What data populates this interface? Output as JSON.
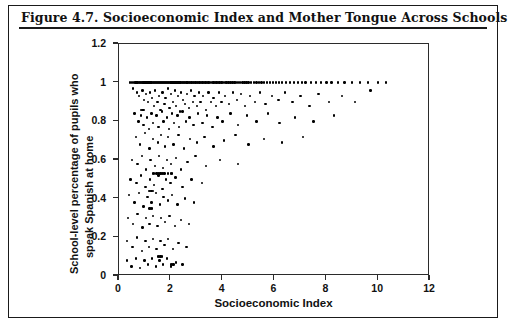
{
  "figure": {
    "title": "Figure 4.7.  Socioeconomic Index and Mother Tongue Across Schools"
  },
  "chart_data": {
    "type": "scatter",
    "title": "Socioeconomic Index and Mother Tongue Across Schools",
    "xlabel": "Socioeconomic Index",
    "ylabel_line1": "School-level percentage of pupils who",
    "ylabel_line2": "speak Spanish at home",
    "xlim": [
      0,
      12
    ],
    "ylim": [
      0,
      1.2
    ],
    "xticks": [
      0,
      2,
      4,
      6,
      8,
      10,
      12
    ],
    "xtick_labels": [
      "0",
      "2",
      "4",
      "6",
      "8",
      "10",
      "12"
    ],
    "yticks": [
      0,
      0.2,
      0.4,
      0.6,
      0.8,
      1,
      1.2
    ],
    "ytick_labels": [
      "0",
      "0.2",
      "0.4",
      "0.6",
      "0.8",
      "1",
      "1.2"
    ],
    "grid": false,
    "legend": null,
    "marker": "filled-circle",
    "marker_color": "#000000",
    "marker_size_px": 2.4,
    "points": [
      [
        0.42,
        1.0
      ],
      [
        0.5,
        1.0
      ],
      [
        0.58,
        1.0
      ],
      [
        0.63,
        1.0
      ],
      [
        0.68,
        1.0
      ],
      [
        0.72,
        1.0
      ],
      [
        0.76,
        1.0
      ],
      [
        0.8,
        1.0
      ],
      [
        0.84,
        1.0
      ],
      [
        0.88,
        1.0
      ],
      [
        0.92,
        1.0
      ],
      [
        0.95,
        1.0
      ],
      [
        0.99,
        1.0
      ],
      [
        1.02,
        1.0
      ],
      [
        1.06,
        1.0
      ],
      [
        1.1,
        1.0
      ],
      [
        1.14,
        1.0
      ],
      [
        1.18,
        1.0
      ],
      [
        1.22,
        1.0
      ],
      [
        1.26,
        1.0
      ],
      [
        1.3,
        1.0
      ],
      [
        1.34,
        1.0
      ],
      [
        1.38,
        1.0
      ],
      [
        1.42,
        1.0
      ],
      [
        1.46,
        1.0
      ],
      [
        1.5,
        1.0
      ],
      [
        1.54,
        1.0
      ],
      [
        1.58,
        1.0
      ],
      [
        1.62,
        1.0
      ],
      [
        1.66,
        1.0
      ],
      [
        1.7,
        1.0
      ],
      [
        1.74,
        1.0
      ],
      [
        1.78,
        1.0
      ],
      [
        1.82,
        1.0
      ],
      [
        1.86,
        1.0
      ],
      [
        1.9,
        1.0
      ],
      [
        1.94,
        1.0
      ],
      [
        1.98,
        1.0
      ],
      [
        2.02,
        1.0
      ],
      [
        2.06,
        1.0
      ],
      [
        2.1,
        1.0
      ],
      [
        2.14,
        1.0
      ],
      [
        2.18,
        1.0
      ],
      [
        2.22,
        1.0
      ],
      [
        2.26,
        1.0
      ],
      [
        2.3,
        1.0
      ],
      [
        2.34,
        1.0
      ],
      [
        2.38,
        1.0
      ],
      [
        2.42,
        1.0
      ],
      [
        2.46,
        1.0
      ],
      [
        2.5,
        1.0
      ],
      [
        2.55,
        1.0
      ],
      [
        2.6,
        1.0
      ],
      [
        2.65,
        1.0
      ],
      [
        2.7,
        1.0
      ],
      [
        2.75,
        1.0
      ],
      [
        2.8,
        1.0
      ],
      [
        2.85,
        1.0
      ],
      [
        2.9,
        1.0
      ],
      [
        2.95,
        1.0
      ],
      [
        3.0,
        1.0
      ],
      [
        3.05,
        1.0
      ],
      [
        3.1,
        1.0
      ],
      [
        3.16,
        1.0
      ],
      [
        3.22,
        1.0
      ],
      [
        3.28,
        1.0
      ],
      [
        3.34,
        1.0
      ],
      [
        3.4,
        1.0
      ],
      [
        3.46,
        1.0
      ],
      [
        3.52,
        1.0
      ],
      [
        3.58,
        1.0
      ],
      [
        3.64,
        1.0
      ],
      [
        3.7,
        1.0
      ],
      [
        3.76,
        1.0
      ],
      [
        3.82,
        1.0
      ],
      [
        3.88,
        1.0
      ],
      [
        3.95,
        1.0
      ],
      [
        4.02,
        1.0
      ],
      [
        4.08,
        1.0
      ],
      [
        4.15,
        1.0
      ],
      [
        4.22,
        1.0
      ],
      [
        4.3,
        1.0
      ],
      [
        4.38,
        1.0
      ],
      [
        4.45,
        1.0
      ],
      [
        4.52,
        1.0
      ],
      [
        4.6,
        1.0
      ],
      [
        4.68,
        1.0
      ],
      [
        4.76,
        1.0
      ],
      [
        4.84,
        1.0
      ],
      [
        4.92,
        1.0
      ],
      [
        5.0,
        1.0
      ],
      [
        5.1,
        1.0
      ],
      [
        5.2,
        1.0
      ],
      [
        5.3,
        1.0
      ],
      [
        5.4,
        1.0
      ],
      [
        5.5,
        1.0
      ],
      [
        5.6,
        1.0
      ],
      [
        5.7,
        1.0
      ],
      [
        5.82,
        1.0
      ],
      [
        5.94,
        1.0
      ],
      [
        6.05,
        1.0
      ],
      [
        6.18,
        1.0
      ],
      [
        6.3,
        1.0
      ],
      [
        6.45,
        1.0
      ],
      [
        6.6,
        1.0
      ],
      [
        6.75,
        1.0
      ],
      [
        6.9,
        1.0
      ],
      [
        7.05,
        1.0
      ],
      [
        7.2,
        1.0
      ],
      [
        7.4,
        1.0
      ],
      [
        7.6,
        1.0
      ],
      [
        7.8,
        1.0
      ],
      [
        8.0,
        1.0
      ],
      [
        8.2,
        1.0
      ],
      [
        8.45,
        1.0
      ],
      [
        8.7,
        1.0
      ],
      [
        9.0,
        1.0
      ],
      [
        9.3,
        1.0
      ],
      [
        9.6,
        1.0
      ],
      [
        10.0,
        1.0
      ],
      [
        10.3,
        1.0
      ],
      [
        0.55,
        0.97
      ],
      [
        0.7,
        0.95
      ],
      [
        0.78,
        0.93
      ],
      [
        0.9,
        0.96
      ],
      [
        0.97,
        0.91
      ],
      [
        1.05,
        0.94
      ],
      [
        1.12,
        0.9
      ],
      [
        1.2,
        0.95
      ],
      [
        1.28,
        0.92
      ],
      [
        1.35,
        0.88
      ],
      [
        1.4,
        0.96
      ],
      [
        1.48,
        0.9
      ],
      [
        1.55,
        0.93
      ],
      [
        1.6,
        0.86
      ],
      [
        1.68,
        0.95
      ],
      [
        1.75,
        0.89
      ],
      [
        1.8,
        0.92
      ],
      [
        1.88,
        0.97
      ],
      [
        1.95,
        0.87
      ],
      [
        2.0,
        0.94
      ],
      [
        2.08,
        0.9
      ],
      [
        2.15,
        0.96
      ],
      [
        2.2,
        0.88
      ],
      [
        2.28,
        0.93
      ],
      [
        2.35,
        0.85
      ],
      [
        2.4,
        0.95
      ],
      [
        2.48,
        0.91
      ],
      [
        2.55,
        0.89
      ],
      [
        2.62,
        0.94
      ],
      [
        2.7,
        0.87
      ],
      [
        2.78,
        0.96
      ],
      [
        2.85,
        0.9
      ],
      [
        2.92,
        0.93
      ],
      [
        3.0,
        0.88
      ],
      [
        3.08,
        0.95
      ],
      [
        3.15,
        0.9
      ],
      [
        3.25,
        0.93
      ],
      [
        3.35,
        0.86
      ],
      [
        3.45,
        0.95
      ],
      [
        3.55,
        0.9
      ],
      [
        3.65,
        0.92
      ],
      [
        3.75,
        0.88
      ],
      [
        3.85,
        0.95
      ],
      [
        3.95,
        0.9
      ],
      [
        4.1,
        0.93
      ],
      [
        4.25,
        0.89
      ],
      [
        4.4,
        0.95
      ],
      [
        4.55,
        0.91
      ],
      [
        4.7,
        0.94
      ],
      [
        4.85,
        0.88
      ],
      [
        5.05,
        0.93
      ],
      [
        5.25,
        0.9
      ],
      [
        5.45,
        0.95
      ],
      [
        5.65,
        0.89
      ],
      [
        5.9,
        0.93
      ],
      [
        6.15,
        0.91
      ],
      [
        6.4,
        0.95
      ],
      [
        6.7,
        0.9
      ],
      [
        7.0,
        0.93
      ],
      [
        7.35,
        0.88
      ],
      [
        7.7,
        0.94
      ],
      [
        8.1,
        0.9
      ],
      [
        8.6,
        0.93
      ],
      [
        9.1,
        0.9
      ],
      [
        9.7,
        0.96
      ],
      [
        0.6,
        0.84
      ],
      [
        0.75,
        0.8
      ],
      [
        0.85,
        0.83
      ],
      [
        0.95,
        0.78
      ],
      [
        1.08,
        0.82
      ],
      [
        1.15,
        0.76
      ],
      [
        1.25,
        0.84
      ],
      [
        1.32,
        0.79
      ],
      [
        1.45,
        0.83
      ],
      [
        1.52,
        0.77
      ],
      [
        1.65,
        0.85
      ],
      [
        1.72,
        0.8
      ],
      [
        1.85,
        0.82
      ],
      [
        1.92,
        0.76
      ],
      [
        2.05,
        0.84
      ],
      [
        2.12,
        0.79
      ],
      [
        2.25,
        0.83
      ],
      [
        2.32,
        0.77
      ],
      [
        2.45,
        0.85
      ],
      [
        2.58,
        0.8
      ],
      [
        2.72,
        0.82
      ],
      [
        2.88,
        0.78
      ],
      [
        3.05,
        0.84
      ],
      [
        3.22,
        0.79
      ],
      [
        3.4,
        0.83
      ],
      [
        3.6,
        0.77
      ],
      [
        3.8,
        0.82
      ],
      [
        4.0,
        0.8
      ],
      [
        4.3,
        0.84
      ],
      [
        4.6,
        0.78
      ],
      [
        4.95,
        0.83
      ],
      [
        5.3,
        0.8
      ],
      [
        5.75,
        0.84
      ],
      [
        6.2,
        0.79
      ],
      [
        6.8,
        0.82
      ],
      [
        7.5,
        0.8
      ],
      [
        8.3,
        0.83
      ],
      [
        0.65,
        0.72
      ],
      [
        0.82,
        0.68
      ],
      [
        1.0,
        0.74
      ],
      [
        1.18,
        0.66
      ],
      [
        1.3,
        0.71
      ],
      [
        1.5,
        0.69
      ],
      [
        1.62,
        0.73
      ],
      [
        1.78,
        0.67
      ],
      [
        1.9,
        0.72
      ],
      [
        2.1,
        0.68
      ],
      [
        2.3,
        0.73
      ],
      [
        2.5,
        0.66
      ],
      [
        2.75,
        0.71
      ],
      [
        3.0,
        0.69
      ],
      [
        3.3,
        0.72
      ],
      [
        3.65,
        0.67
      ],
      [
        4.05,
        0.7
      ],
      [
        4.5,
        0.73
      ],
      [
        5.0,
        0.68
      ],
      [
        5.6,
        0.71
      ],
      [
        6.3,
        0.69
      ],
      [
        7.1,
        0.72
      ],
      [
        0.5,
        0.6
      ],
      [
        0.72,
        0.58
      ],
      [
        0.88,
        0.62
      ],
      [
        1.05,
        0.55
      ],
      [
        1.22,
        0.6
      ],
      [
        1.38,
        0.57
      ],
      [
        1.55,
        0.62
      ],
      [
        1.7,
        0.56
      ],
      [
        1.85,
        0.6
      ],
      [
        2.0,
        0.58
      ],
      [
        2.2,
        0.61
      ],
      [
        2.4,
        0.55
      ],
      [
        2.65,
        0.59
      ],
      [
        2.95,
        0.62
      ],
      [
        3.35,
        0.57
      ],
      [
        3.9,
        0.6
      ],
      [
        4.6,
        0.58
      ],
      [
        0.45,
        0.5
      ],
      [
        0.68,
        0.48
      ],
      [
        0.85,
        0.52
      ],
      [
        1.02,
        0.46
      ],
      [
        1.2,
        0.5
      ],
      [
        1.35,
        0.47
      ],
      [
        1.52,
        0.52
      ],
      [
        1.68,
        0.45
      ],
      [
        1.82,
        0.5
      ],
      [
        1.98,
        0.48
      ],
      [
        2.18,
        0.51
      ],
      [
        2.45,
        0.46
      ],
      [
        2.8,
        0.5
      ],
      [
        3.2,
        0.48
      ],
      [
        0.38,
        0.42
      ],
      [
        0.6,
        0.38
      ],
      [
        0.78,
        0.43
      ],
      [
        0.95,
        0.36
      ],
      [
        1.1,
        0.41
      ],
      [
        1.25,
        0.38
      ],
      [
        1.42,
        0.43
      ],
      [
        1.58,
        0.37
      ],
      [
        1.72,
        0.41
      ],
      [
        1.88,
        0.39
      ],
      [
        2.05,
        0.42
      ],
      [
        2.25,
        0.37
      ],
      [
        2.55,
        0.4
      ],
      [
        2.9,
        0.38
      ],
      [
        0.35,
        0.3
      ],
      [
        0.55,
        0.27
      ],
      [
        0.72,
        0.32
      ],
      [
        0.9,
        0.25
      ],
      [
        1.05,
        0.3
      ],
      [
        1.18,
        0.27
      ],
      [
        1.32,
        0.31
      ],
      [
        1.48,
        0.26
      ],
      [
        1.62,
        0.3
      ],
      [
        1.78,
        0.28
      ],
      [
        1.95,
        0.31
      ],
      [
        2.15,
        0.26
      ],
      [
        2.4,
        0.29
      ],
      [
        2.7,
        0.27
      ],
      [
        0.32,
        0.18
      ],
      [
        0.52,
        0.15
      ],
      [
        0.7,
        0.2
      ],
      [
        0.88,
        0.13
      ],
      [
        1.02,
        0.18
      ],
      [
        1.15,
        0.15
      ],
      [
        1.3,
        0.19
      ],
      [
        1.45,
        0.14
      ],
      [
        1.6,
        0.18
      ],
      [
        1.75,
        0.16
      ],
      [
        1.9,
        0.19
      ],
      [
        2.08,
        0.14
      ],
      [
        2.3,
        0.17
      ],
      [
        2.6,
        0.15
      ],
      [
        0.3,
        0.08
      ],
      [
        0.48,
        0.05
      ],
      [
        0.65,
        0.09
      ],
      [
        0.82,
        0.04
      ],
      [
        0.98,
        0.08
      ],
      [
        1.12,
        0.06
      ],
      [
        1.28,
        0.09
      ],
      [
        1.42,
        0.05
      ],
      [
        1.56,
        0.08
      ],
      [
        1.7,
        0.06
      ],
      [
        1.85,
        0.09
      ],
      [
        2.0,
        0.05
      ],
      [
        2.2,
        0.07
      ],
      [
        2.45,
        0.06
      ],
      [
        0.3,
        0.0
      ],
      [
        0.35,
        0.0
      ],
      [
        0.4,
        0.0
      ],
      [
        0.45,
        0.0
      ],
      [
        0.5,
        0.0
      ],
      [
        0.55,
        0.0
      ],
      [
        0.6,
        0.0
      ],
      [
        0.65,
        0.0
      ],
      [
        0.7,
        0.0
      ],
      [
        0.75,
        0.0
      ],
      [
        0.8,
        0.0
      ],
      [
        0.85,
        0.0
      ],
      [
        0.9,
        0.0
      ],
      [
        0.95,
        0.0
      ],
      [
        1.0,
        0.0
      ],
      [
        1.05,
        0.0
      ],
      [
        1.1,
        0.0
      ],
      [
        1.15,
        0.0
      ],
      [
        1.2,
        0.0
      ],
      [
        1.25,
        0.0
      ],
      [
        1.3,
        0.0
      ],
      [
        1.35,
        0.0
      ],
      [
        1.4,
        0.0
      ],
      [
        1.45,
        0.0
      ],
      [
        1.5,
        0.0
      ],
      [
        1.55,
        0.0
      ],
      [
        1.6,
        0.0
      ],
      [
        1.65,
        0.0
      ],
      [
        1.7,
        0.0
      ],
      [
        1.75,
        0.0
      ],
      [
        1.8,
        0.0
      ],
      [
        1.85,
        0.0
      ],
      [
        1.9,
        0.0
      ],
      [
        1.95,
        0.0
      ],
      [
        2.0,
        0.0
      ],
      [
        2.05,
        0.0
      ],
      [
        2.12,
        0.0
      ],
      [
        2.2,
        0.0
      ],
      [
        2.28,
        0.0
      ],
      [
        2.36,
        0.0
      ],
      [
        2.45,
        0.0
      ],
      [
        2.55,
        0.0
      ],
      [
        2.65,
        0.0
      ],
      [
        2.78,
        0.0
      ],
      [
        2.95,
        0.0
      ],
      [
        3.15,
        0.0
      ],
      [
        3.4,
        0.0
      ],
      [
        3.75,
        0.0
      ],
      [
        4.1,
        0.0
      ],
      [
        4.35,
        0.0
      ],
      [
        4.45,
        0.0
      ],
      [
        5.0,
        0.0
      ],
      [
        5.2,
        0.0
      ],
      [
        1.45,
        0.53
      ],
      [
        1.5,
        0.53
      ],
      [
        1.55,
        0.53
      ],
      [
        1.6,
        0.53
      ],
      [
        1.65,
        0.53
      ],
      [
        1.7,
        0.53
      ],
      [
        1.75,
        0.53
      ],
      [
        1.3,
        0.53
      ],
      [
        1.35,
        0.53
      ],
      [
        1.9,
        0.53
      ],
      [
        2.0,
        0.53
      ],
      [
        2.05,
        0.53
      ],
      [
        1.15,
        0.44
      ],
      [
        1.2,
        0.44
      ],
      [
        1.25,
        0.44
      ],
      [
        1.3,
        0.44
      ],
      [
        1.18,
        0.35
      ],
      [
        1.23,
        0.35
      ],
      [
        1.28,
        0.35
      ],
      [
        1.5,
        0.1
      ],
      [
        1.55,
        0.1
      ],
      [
        1.6,
        0.1
      ],
      [
        1.65,
        0.1
      ],
      [
        0.85,
        0.86
      ],
      [
        0.9,
        0.86
      ],
      [
        0.95,
        0.86
      ],
      [
        2.0,
        0.06
      ],
      [
        2.05,
        0.06
      ],
      [
        2.1,
        0.06
      ]
    ]
  }
}
